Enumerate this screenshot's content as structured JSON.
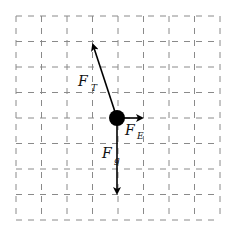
{
  "diagram": {
    "grid": {
      "columns": 8,
      "rows": 8,
      "origin_x": 16,
      "origin_y": 16,
      "cell": 25.5,
      "line_color": "#8a8a8a",
      "dash": "6,6"
    },
    "body": {
      "name": "ball",
      "cx": 117,
      "cy": 118,
      "r": 8,
      "color": "#000000"
    },
    "forces": [
      {
        "id": "tension",
        "symbol": "F",
        "subscript": "T",
        "from": [
          117,
          118
        ],
        "to": [
          93,
          45
        ],
        "label_x": 78,
        "label_y": 86,
        "sub_x": 91,
        "sub_y": 91
      },
      {
        "id": "electric",
        "symbol": "F",
        "subscript": "E",
        "from": [
          117,
          118
        ],
        "to": [
          142,
          118
        ],
        "label_x": 125,
        "label_y": 135,
        "sub_x": 137,
        "sub_y": 139
      },
      {
        "id": "gravity",
        "symbol": "F",
        "subscript": "g",
        "from": [
          117,
          118
        ],
        "to": [
          117,
          193
        ],
        "label_x": 102,
        "label_y": 158,
        "sub_x": 114,
        "sub_y": 163
      }
    ],
    "arrow_color": "#000000"
  }
}
